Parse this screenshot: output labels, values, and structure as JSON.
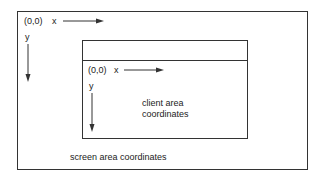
{
  "screen": {
    "origin_label": "(0,0)",
    "x_axis_label": "x",
    "y_axis_label": "y",
    "caption": "screen area coordinates"
  },
  "client": {
    "origin_label": "(0,0)",
    "x_axis_label": "x",
    "y_axis_label": "y",
    "caption_line1": "client area",
    "caption_line2": "coordinates"
  },
  "colors": {
    "line": "#333333",
    "background": "#ffffff"
  }
}
